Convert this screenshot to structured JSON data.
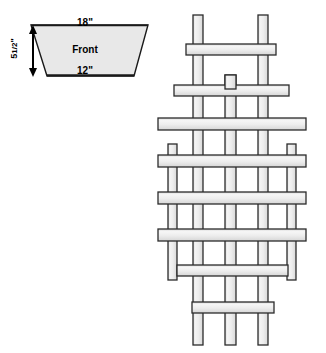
{
  "figure": {
    "title_hidden": "",
    "trapezoid": {
      "name": "front-panel",
      "face_label": "Front",
      "top_width_label": "18\"",
      "bottom_width_label": "12\"",
      "height_label_whole": "5",
      "height_label_fraction": "1/2",
      "height_label_unit": "\"",
      "height_label_full": "5 1/2\"",
      "fill_color": "#e8e8e8",
      "stroke_color": "#1a1a1a"
    },
    "trellis": {
      "name": "lattice-trellis",
      "slat_fill_color": "#ececec",
      "slat_stroke_color": "#2b2b2b",
      "slat_highlight_color": "#f7f7f7",
      "vertical_slats": [
        {
          "id": "v1",
          "x": 168,
          "y": 144,
          "w": 9,
          "h": 136
        },
        {
          "id": "v2",
          "x": 193,
          "y": 15,
          "w": 10,
          "h": 330
        },
        {
          "id": "v3",
          "x": 225,
          "y": 75,
          "w": 11,
          "h": 270
        },
        {
          "id": "v4",
          "x": 258,
          "y": 15,
          "w": 10,
          "h": 330
        },
        {
          "id": "v5",
          "x": 287,
          "y": 144,
          "w": 9,
          "h": 136
        }
      ],
      "horizontal_rails": [
        {
          "id": "h1",
          "x": 186,
          "y": 44,
          "w": 90,
          "h": 11
        },
        {
          "id": "h2",
          "x": 174,
          "y": 85,
          "w": 115,
          "h": 11
        },
        {
          "id": "h3",
          "x": 158,
          "y": 118,
          "w": 148,
          "h": 12
        },
        {
          "id": "h4",
          "x": 158,
          "y": 155,
          "w": 148,
          "h": 12
        },
        {
          "id": "h5",
          "x": 158,
          "y": 192,
          "w": 148,
          "h": 12
        },
        {
          "id": "h6",
          "x": 158,
          "y": 229,
          "w": 148,
          "h": 12
        },
        {
          "id": "h7",
          "x": 177,
          "y": 265,
          "w": 111,
          "h": 11
        },
        {
          "id": "h8",
          "x": 192,
          "y": 302,
          "w": 82,
          "h": 11
        }
      ],
      "center_stub": {
        "id": "v3-top-cap",
        "x": 225,
        "y": 75,
        "w": 11,
        "h": 14
      }
    },
    "dimension_arrow": {
      "name": "height-dimension-arrow",
      "x": 33,
      "y_top": 26,
      "y_bottom": 76,
      "color": "#000000"
    }
  }
}
